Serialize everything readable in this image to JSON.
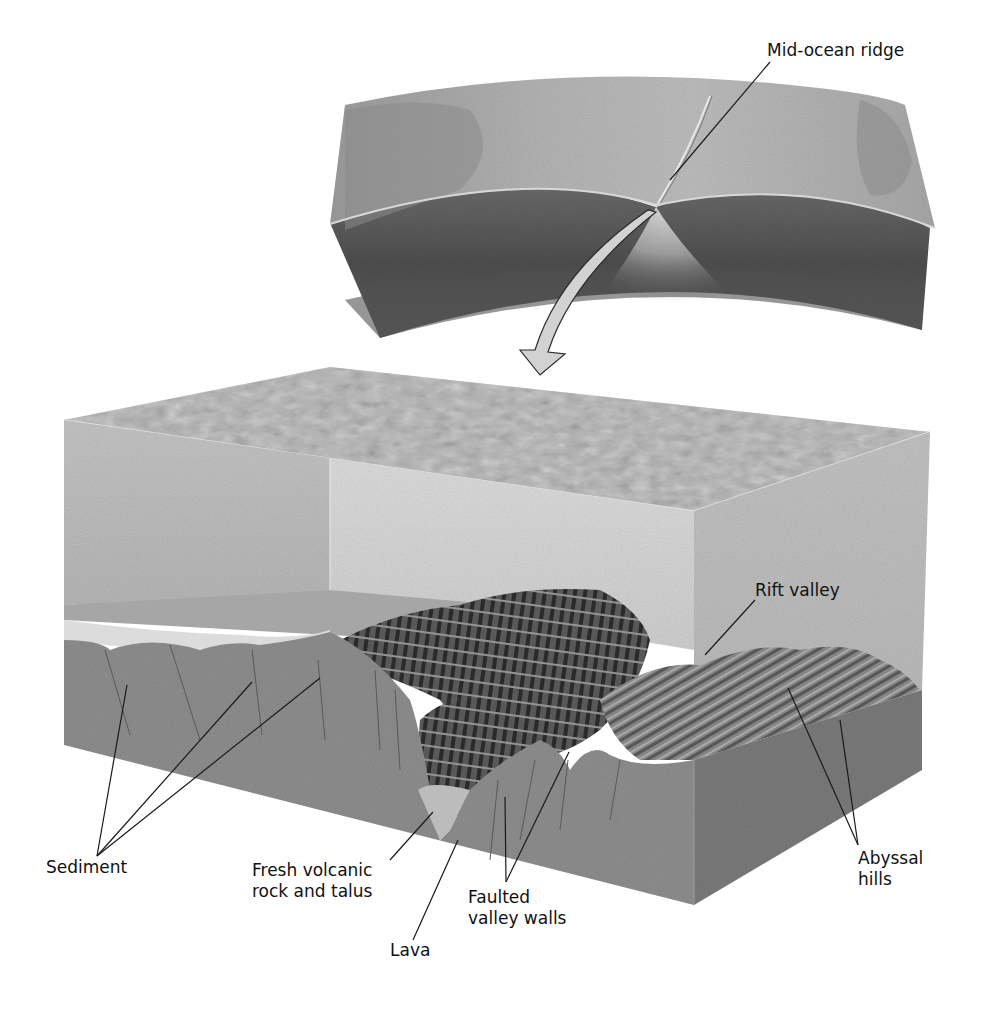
{
  "figure": {
    "colors": {
      "background": "#ffffff",
      "slab_top": "#a9a9a9",
      "slab_side_dark": "#5a5a5a",
      "water_top": "#b8b8b8",
      "water_wall": "#c8c8c8",
      "crust_front": "#8e8e8e",
      "crust_right": "#7a7a7a",
      "ridge_dark": "#3a3a3a",
      "sediment": "#d9d9d9",
      "arrow_fill": "#d2d2d2",
      "leader_line": "#1a1a1a"
    },
    "labels": {
      "mid_ocean_ridge": "Mid-ocean ridge",
      "rift_valley": "Rift valley",
      "sediment": "Sediment",
      "fresh_volcanic": [
        "Fresh volcanic",
        "rock and talus"
      ],
      "lava": "Lava",
      "faulted_walls": [
        "Faulted",
        "valley walls"
      ],
      "abyssal_hills": [
        "Abyssal",
        "hills"
      ]
    }
  }
}
